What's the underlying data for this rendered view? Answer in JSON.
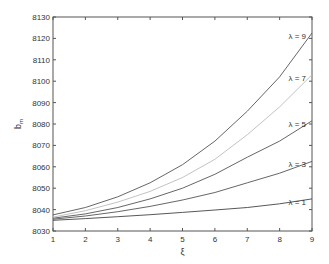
{
  "chart_data": {
    "type": "line",
    "title": "",
    "xlabel": "ξ",
    "ylabel": "b_m",
    "xlim": [
      1,
      9
    ],
    "ylim": [
      8030,
      8130
    ],
    "grid": false,
    "legend_position": "inline-right",
    "x": [
      1,
      2,
      3,
      4,
      5,
      6,
      7,
      8,
      9
    ],
    "x_ticks": [
      "1",
      "2",
      "3",
      "4",
      "5",
      "6",
      "7",
      "8",
      "9"
    ],
    "y_ticks": [
      "8030",
      "8040",
      "8050",
      "8060",
      "8070",
      "8080",
      "8090",
      "8100",
      "8110",
      "8120",
      "8130"
    ],
    "series": [
      {
        "name": "λ = 1",
        "color": "#444444",
        "values": [
          8035,
          8035.8,
          8036.7,
          8037.6,
          8038.7,
          8039.8,
          8041,
          8042.7,
          8045
        ]
      },
      {
        "name": "λ = 3",
        "color": "#555555",
        "values": [
          8035.5,
          8037,
          8039,
          8041.5,
          8044.5,
          8048,
          8052.5,
          8057,
          8062.5
        ]
      },
      {
        "name": "λ = 5",
        "color": "#555555",
        "values": [
          8036,
          8038,
          8041,
          8045,
          8050,
          8056.5,
          8064.5,
          8072,
          8081.5
        ]
      },
      {
        "name": "λ = 7",
        "color": "#bbbbbb",
        "values": [
          8036.5,
          8039.5,
          8043.5,
          8048.5,
          8055,
          8063.5,
          8075,
          8088,
          8103
        ]
      },
      {
        "name": "λ = 9",
        "color": "#555555",
        "values": [
          8037.5,
          8041,
          8046,
          8052.5,
          8061,
          8072,
          8086,
          8102,
          8122.5
        ]
      }
    ]
  }
}
